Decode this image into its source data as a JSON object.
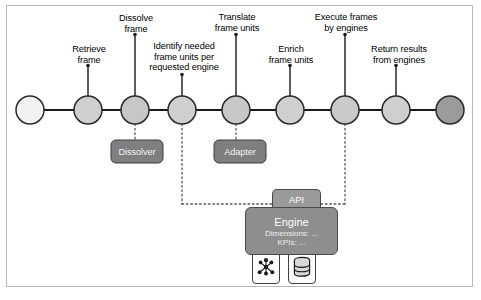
{
  "diagram": {
    "type": "pipeline-flow",
    "title": "",
    "stages": [
      {
        "id": "start",
        "label": "",
        "cx": 30,
        "node_fill": "#f2f2f2",
        "has_stem": false
      },
      {
        "id": "retrieve",
        "label": "Retrieve\nframe",
        "cx": 88,
        "node_fill": "#cfcfcf",
        "has_stem": true,
        "label_x": 52,
        "label_y": 44,
        "label_w": 74,
        "stem_top": 66
      },
      {
        "id": "dissolve",
        "label": "Dissolve\nframe",
        "cx": 135,
        "node_fill": "#c7c7c7",
        "has_stem": true,
        "label_x": 99,
        "label_y": 13,
        "label_w": 74,
        "stem_top": 35
      },
      {
        "id": "identify",
        "label": "Identify needed\nframe units per\nrequested engine",
        "cx": 182,
        "node_fill": "#cfcfcf",
        "has_stem": true,
        "label_x": 139,
        "label_y": 41,
        "label_w": 90,
        "stem_top": 75
      },
      {
        "id": "translate",
        "label": "Translate\nframe units",
        "cx": 236,
        "node_fill": "#c7c7c7",
        "has_stem": true,
        "label_x": 197,
        "label_y": 12,
        "label_w": 80,
        "stem_top": 35
      },
      {
        "id": "enrich",
        "label": "Enrich\nframe units",
        "cx": 290,
        "node_fill": "#cfcfcf",
        "has_stem": true,
        "label_x": 252,
        "label_y": 44,
        "label_w": 78,
        "stem_top": 66
      },
      {
        "id": "execute",
        "label": "Execute frames\nby engines",
        "cx": 345,
        "node_fill": "#cacaca",
        "has_stem": true,
        "label_x": 301,
        "label_y": 12,
        "label_w": 90,
        "stem_top": 35
      },
      {
        "id": "return",
        "label": "Return results\nfrom engines",
        "cx": 396,
        "node_fill": "#cfcfcf",
        "has_stem": true,
        "label_x": 357,
        "label_y": 44,
        "label_w": 84,
        "stem_top": 66
      },
      {
        "id": "end",
        "label": "",
        "cx": 450,
        "node_fill": "#9b9b9b",
        "has_stem": false
      }
    ],
    "node_radius": 14,
    "node_center_y": 110,
    "components": [
      {
        "id": "dissolver",
        "label": "Dissolver",
        "x": 111,
        "y": 140,
        "w": 52,
        "h": 23,
        "fill": "#7f7f7f",
        "connects_to_stage": "dissolve"
      },
      {
        "id": "adapter",
        "label": "Adapter",
        "x": 214,
        "y": 140,
        "w": 52,
        "h": 23,
        "fill": "#7f7f7f",
        "connects_to_stage": "translate"
      }
    ],
    "api": {
      "label": "API"
    },
    "engine": {
      "title": "Engine",
      "dimensions_line": "Dimensions: ...",
      "kpis_line": "KPIs: ..."
    },
    "icons": [
      {
        "id": "cluster",
        "name": "network-cluster-icon"
      },
      {
        "id": "database",
        "name": "database-icon"
      }
    ],
    "connectors": {
      "dotted_from_identify_x": 182,
      "dotted_from_execute_x": 345,
      "dotted_bus_y": 204
    },
    "colors": {
      "line": "#1a1a1a",
      "node_stroke": "#2a2a2a",
      "box_fill": "#7f7f7f",
      "engine_fill": "#8e8e8e",
      "api_fill": "#9a9a9a",
      "border": "#b9b9b9",
      "text": "#000000",
      "box_text": "#ffffff"
    }
  }
}
